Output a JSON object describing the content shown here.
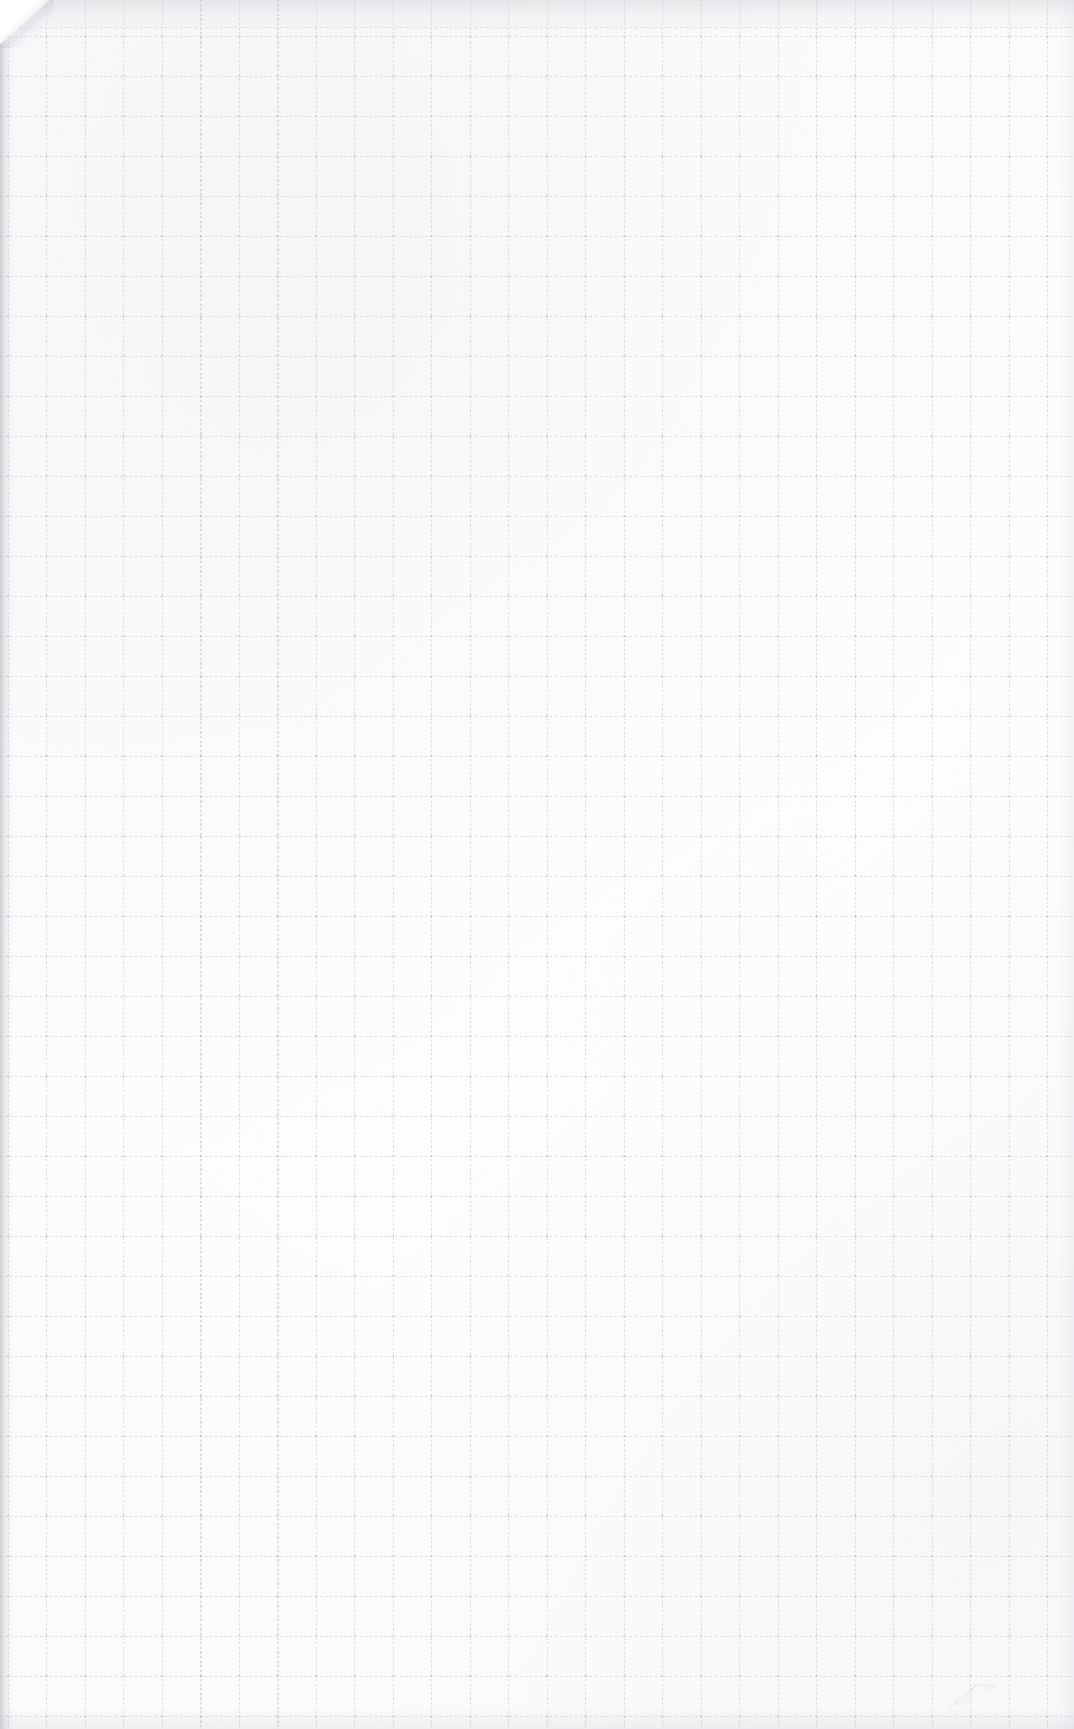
{
  "document": {
    "kind": "scanned-grid-paper",
    "title": "Blank graph paper scan",
    "text_content": "",
    "visible_text_count": 0
  },
  "page": {
    "width": 1074,
    "height": 1729,
    "background_color": "#fdfdfd",
    "paper_tone": "#ffffff"
  },
  "grid": {
    "description": "faint dotted ruling",
    "line_color": "#9ea3ad",
    "line_opacity": "0.34",
    "cell_width_px": 38.5,
    "cell_height_px": 40,
    "origin_x_px": 8,
    "origin_y_px": 36,
    "style": "dotted",
    "columns": 28,
    "rows": 43
  },
  "artifacts": {
    "corner_fold": {
      "name": "top-left folded corner",
      "x": 0,
      "y": 0,
      "width": 54,
      "height": 48,
      "shadow_color": "#aaaeb6"
    },
    "edges": [
      {
        "name": "left-scan-shadow",
        "side": "left",
        "thickness_px": 14,
        "color": "#787c84"
      },
      {
        "name": "top-scan-shadow",
        "side": "top",
        "thickness_px": 34,
        "color": "#b0b4bc"
      },
      {
        "name": "bottom-scan-shadow",
        "side": "bottom",
        "thickness_px": 22,
        "color": "#bac0c6"
      },
      {
        "name": "right-scan-shadow",
        "side": "right",
        "thickness_px": 16,
        "color": "#bec2ca"
      }
    ],
    "pencil_smudge": {
      "name": "faint pencil mark",
      "x": 942,
      "y": 1672,
      "width": 78,
      "height": 42,
      "color": "#b9bcc4",
      "opacity": 0.5
    }
  }
}
